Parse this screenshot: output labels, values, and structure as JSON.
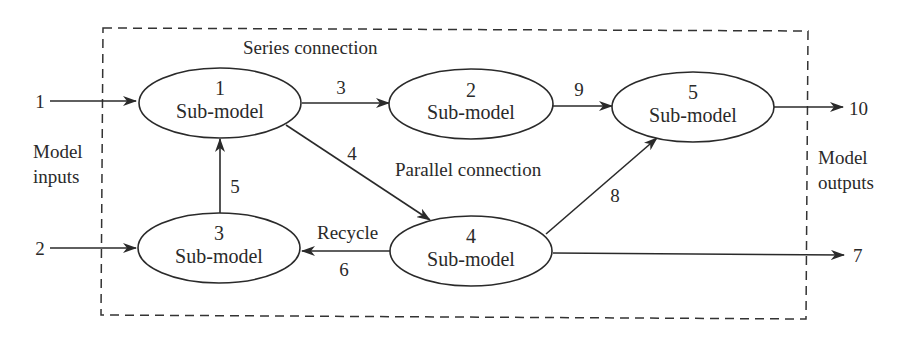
{
  "diagram": {
    "boundary_labels": {
      "series": "Series connection",
      "parallel": "Parallel connection",
      "recycle": "Recycle",
      "inputs_line1": "Model",
      "inputs_line2": "inputs",
      "outputs_line1": "Model",
      "outputs_line2": "outputs"
    },
    "nodes": [
      {
        "id": "1",
        "label": "Sub-model"
      },
      {
        "id": "2",
        "label": "Sub-model"
      },
      {
        "id": "3",
        "label": "Sub-model"
      },
      {
        "id": "4",
        "label": "Sub-model"
      },
      {
        "id": "5",
        "label": "Sub-model"
      }
    ],
    "streams": {
      "s1": "1",
      "s2": "2",
      "s3": "3",
      "s4": "4",
      "s5": "5",
      "s6": "6",
      "s7": "7",
      "s8": "8",
      "s9": "9",
      "s10": "10"
    },
    "edges": [
      {
        "stream": "1",
        "from": "input",
        "to": "1"
      },
      {
        "stream": "2",
        "from": "input",
        "to": "3"
      },
      {
        "stream": "3",
        "from": "1",
        "to": "2"
      },
      {
        "stream": "4",
        "from": "1",
        "to": "4"
      },
      {
        "stream": "5",
        "from": "3",
        "to": "1"
      },
      {
        "stream": "6",
        "from": "4",
        "to": "3"
      },
      {
        "stream": "7",
        "from": "4",
        "to": "output"
      },
      {
        "stream": "8",
        "from": "4",
        "to": "5"
      },
      {
        "stream": "9",
        "from": "2",
        "to": "5"
      },
      {
        "stream": "10",
        "from": "5",
        "to": "output"
      }
    ],
    "colors": {
      "ink": "#2a2a2a",
      "background": "#ffffff"
    }
  }
}
